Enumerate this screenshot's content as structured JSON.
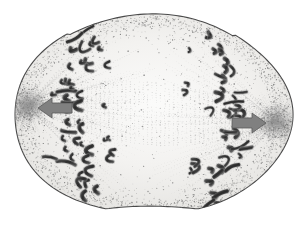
{
  "figure": {
    "domain": "Natural-Image",
    "title": "Anaphase of mitosis",
    "subtitle": "Light-micrograph style drawing of a dividing cell",
    "medium": "grayscale stipple engraving",
    "background_color": "#ffffff",
    "cell_fill_color": "#f2f1ef",
    "cell_outline_color": "#4a4a4a",
    "stipple_color": "#7d7d7d",
    "chromosome_color": "#3a3a3a",
    "chromosome_highlight_color": "#6e6e6e",
    "spindle_fiber_color": "#9a9a9a",
    "aster_color": "#8c8c8c",
    "arrow_fill_color": "#808080",
    "arrow_outline_color": "#5a5a5a"
  },
  "cell": {
    "label": "dividing cell",
    "shape": "oblate ellipse with slight basal cleavage furrow",
    "center_x": 152,
    "center_y": 114,
    "radius_x": 139,
    "radius_y": 101,
    "outline_width": 1.1
  },
  "poles": [
    {
      "name": "left-spindle-pole",
      "label": "spindle pole (aster / centrosome)",
      "cx": 27,
      "cy": 105,
      "r": 15
    },
    {
      "name": "right-spindle-pole",
      "label": "spindle pole (aster / centrosome)",
      "cx": 277,
      "cy": 122,
      "r": 15
    }
  ],
  "arrows": [
    {
      "name": "left-movement-arrow",
      "label": "direction of chromosome movement (toward left pole)",
      "direction": "left",
      "tip_x": 38,
      "tip_y": 108,
      "tail_x": 72,
      "tail_y": 108,
      "shaft_half_height": 5,
      "head_half_height": 10,
      "head_length": 14
    },
    {
      "name": "right-movement-arrow",
      "label": "direction of chromosome movement (toward right pole)",
      "direction": "right",
      "tip_x": 266,
      "tip_y": 123,
      "tail_x": 232,
      "tail_y": 123,
      "shaft_half_height": 5,
      "head_half_height": 10,
      "head_length": 14
    }
  ],
  "chromosome_groups": [
    {
      "name": "left-chromosome-mass",
      "label": "daughter chromosome set moving to left pole",
      "count": 34,
      "axis_x": 92,
      "axis_top_y": 28,
      "axis_bottom_y": 200
    },
    {
      "name": "right-chromosome-mass",
      "label": "daughter chromosome set moving to right pole",
      "count": 34,
      "axis_x": 212,
      "axis_top_y": 30,
      "axis_bottom_y": 205
    }
  ],
  "interzone": {
    "name": "interzonal-spindle",
    "label": "interzonal spindle fibers between separating chromosome sets",
    "x_start": 118,
    "x_end": 192
  },
  "structures_depicted": [
    "cell membrane",
    "stippled cytoplasm",
    "aster at each spindle pole",
    "astral microtubules",
    "kinetochore microtubules",
    "interzonal spindle fibers",
    "two separating sets of V-shaped chromosomes",
    "incipient cleavage furrow"
  ],
  "stage": {
    "phase_name": "Anaphase",
    "process": "Mitosis",
    "description": "Sister chromatids have separated and are being pulled toward opposite spindle poles."
  },
  "annotations": {
    "text_labels_present": "none",
    "scale_bar_present": "none"
  }
}
